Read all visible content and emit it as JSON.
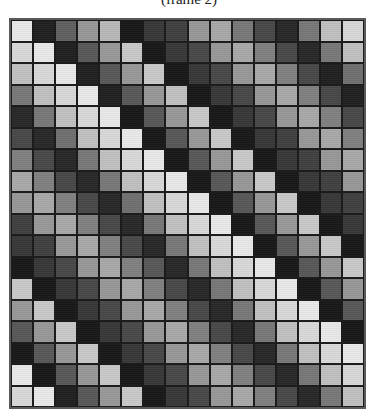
{
  "title": "(frame 2)",
  "chart_data": {
    "type": "heatmap",
    "title": "(frame 2)",
    "colormap": "grayscale",
    "rows": 18,
    "cols": 16,
    "structure": "circulant (each row is the previous row shifted right by one column)",
    "xlabel": "",
    "ylabel": "",
    "grid": true,
    "values_hex_gray": [
      [
        "e8",
        "20",
        "60",
        "98",
        "b8",
        "18",
        "38",
        "40",
        "98",
        "a8",
        "78",
        "48",
        "28",
        "78",
        "c0",
        "d8"
      ],
      [
        "d8",
        "e8",
        "20",
        "58",
        "98",
        "c8",
        "18",
        "38",
        "48",
        "98",
        "a8",
        "80",
        "48",
        "28",
        "78",
        "c0"
      ],
      [
        "c0",
        "d8",
        "e8",
        "20",
        "58",
        "98",
        "c8",
        "18",
        "38",
        "48",
        "98",
        "a8",
        "80",
        "48",
        "20",
        "70"
      ],
      [
        "78",
        "c0",
        "d8",
        "e8",
        "20",
        "58",
        "98",
        "c0",
        "18",
        "38",
        "48",
        "98",
        "a8",
        "80",
        "48",
        "20"
      ],
      [
        "28",
        "78",
        "c0",
        "d8",
        "e8",
        "18",
        "58",
        "98",
        "c8",
        "18",
        "38",
        "48",
        "98",
        "a8",
        "80",
        "48"
      ],
      [
        "48",
        "28",
        "70",
        "c0",
        "d8",
        "e8",
        "18",
        "58",
        "98",
        "c8",
        "18",
        "38",
        "40",
        "98",
        "a8",
        "80"
      ],
      [
        "80",
        "48",
        "28",
        "78",
        "c0",
        "d8",
        "e8",
        "18",
        "58",
        "98",
        "c8",
        "18",
        "38",
        "40",
        "98",
        "a8"
      ],
      [
        "a8",
        "80",
        "48",
        "28",
        "78",
        "c0",
        "d8",
        "e8",
        "18",
        "58",
        "98",
        "c8",
        "18",
        "38",
        "40",
        "98"
      ],
      [
        "98",
        "a8",
        "80",
        "48",
        "28",
        "70",
        "c0",
        "d8",
        "e8",
        "18",
        "58",
        "98",
        "c8",
        "18",
        "38",
        "40"
      ],
      [
        "40",
        "98",
        "a8",
        "80",
        "48",
        "28",
        "78",
        "c0",
        "d8",
        "e8",
        "18",
        "58",
        "98",
        "c8",
        "18",
        "38"
      ],
      [
        "38",
        "40",
        "98",
        "a8",
        "80",
        "48",
        "28",
        "78",
        "c0",
        "d8",
        "e8",
        "18",
        "58",
        "98",
        "c8",
        "18"
      ],
      [
        "18",
        "38",
        "48",
        "98",
        "a8",
        "80",
        "58",
        "28",
        "78",
        "c0",
        "d8",
        "e8",
        "18",
        "58",
        "98",
        "c8"
      ],
      [
        "c8",
        "18",
        "38",
        "48",
        "98",
        "a8",
        "80",
        "48",
        "28",
        "78",
        "c0",
        "d8",
        "e8",
        "18",
        "58",
        "98"
      ],
      [
        "98",
        "c8",
        "18",
        "38",
        "48",
        "98",
        "a8",
        "80",
        "48",
        "28",
        "78",
        "c0",
        "d8",
        "e8",
        "18",
        "58"
      ],
      [
        "58",
        "98",
        "c8",
        "18",
        "38",
        "48",
        "98",
        "a8",
        "80",
        "48",
        "28",
        "78",
        "c0",
        "d8",
        "e8",
        "18"
      ],
      [
        "18",
        "58",
        "98",
        "c8",
        "18",
        "38",
        "48",
        "98",
        "a8",
        "80",
        "48",
        "28",
        "78",
        "c0",
        "d8",
        "e8"
      ],
      [
        "e8",
        "18",
        "58",
        "98",
        "c8",
        "18",
        "38",
        "48",
        "98",
        "a8",
        "80",
        "48",
        "28",
        "78",
        "c0",
        "d8"
      ],
      [
        "d8",
        "e8",
        "20",
        "58",
        "98",
        "c8",
        "18",
        "38",
        "48",
        "98",
        "a8",
        "80",
        "48",
        "28",
        "78",
        "c0"
      ]
    ]
  }
}
